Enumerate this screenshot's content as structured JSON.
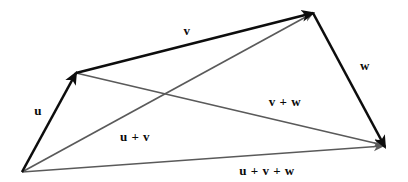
{
  "figure": {
    "background_color": "#ffffff",
    "width": 408,
    "height": 182
  },
  "chart_data": {
    "type": "diagram",
    "subtype": "vector-addition",
    "title": "",
    "xlabel": "",
    "ylabel": "",
    "grid": false,
    "legend": "none",
    "colors": {
      "primary_vector": "#0d0d0d",
      "resultant_vector": "#5a5a5a",
      "label_text": "#0a0a0a",
      "background": "#ffffff"
    },
    "points": [
      {
        "id": "origin",
        "label": "O",
        "x": 22,
        "y": 172
      },
      {
        "id": "u_tip",
        "label": "A",
        "x": 76,
        "y": 73
      },
      {
        "id": "v_tip",
        "label": "B",
        "x": 313,
        "y": 13
      },
      {
        "id": "w_tip",
        "label": "C",
        "x": 385,
        "y": 147
      }
    ],
    "vectors": [
      {
        "name": "u",
        "label": "u",
        "style": "primary",
        "color": "#0d0d0d",
        "stroke_width": 2.6,
        "from": "origin",
        "to": "u_tip",
        "x1": 22,
        "y1": 172,
        "x2": 76,
        "y2": 73,
        "label_x": 38,
        "label_y": 112
      },
      {
        "name": "v",
        "label": "v",
        "style": "primary",
        "color": "#0d0d0d",
        "stroke_width": 2.6,
        "from": "u_tip",
        "to": "v_tip",
        "x1": 76,
        "y1": 73,
        "x2": 313,
        "y2": 13,
        "label_x": 187,
        "label_y": 32
      },
      {
        "name": "w",
        "label": "w",
        "style": "primary",
        "color": "#0d0d0d",
        "stroke_width": 2.6,
        "from": "v_tip",
        "to": "w_tip",
        "x1": 313,
        "y1": 13,
        "x2": 385,
        "y2": 147,
        "label_x": 365,
        "label_y": 67
      },
      {
        "name": "u-plus-v",
        "label": "u + v",
        "style": "resultant",
        "color": "#5a5a5a",
        "stroke_width": 1.7,
        "from": "origin",
        "to": "v_tip",
        "x1": 22,
        "y1": 172,
        "x2": 313,
        "y2": 13,
        "label_x": 135,
        "label_y": 138
      },
      {
        "name": "v-plus-w",
        "label": "v + w",
        "style": "resultant",
        "color": "#5a5a5a",
        "stroke_width": 1.7,
        "from": "u_tip",
        "to": "w_tip",
        "x1": 76,
        "y1": 73,
        "x2": 383,
        "y2": 145,
        "label_x": 285,
        "label_y": 103
      },
      {
        "name": "u-plus-v-plus-w",
        "label": "u + v + w",
        "style": "resultant",
        "color": "#5a5a5a",
        "stroke_width": 1.7,
        "from": "origin",
        "to": "w_tip",
        "x1": 22,
        "y1": 172,
        "x2": 383,
        "y2": 146,
        "label_x": 267,
        "label_y": 172
      }
    ],
    "labels": [
      {
        "name": "u",
        "text": "u",
        "x": 38,
        "y": 112
      },
      {
        "name": "v",
        "text": "v",
        "x": 187,
        "y": 32
      },
      {
        "name": "w",
        "text": "w",
        "x": 365,
        "y": 67
      },
      {
        "name": "u-plus-v",
        "text": "u + v",
        "x": 135,
        "y": 138
      },
      {
        "name": "v-plus-w",
        "text": "v + w",
        "x": 285,
        "y": 103
      },
      {
        "name": "u-plus-v-plus-w",
        "text": "u + v + w",
        "x": 267,
        "y": 172
      }
    ]
  }
}
